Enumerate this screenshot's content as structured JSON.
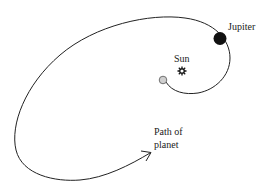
{
  "diagram": {
    "labels": {
      "jupiter": "Jupiter",
      "sun": "Sun",
      "path_line1": "Path of",
      "path_line2": "planet"
    },
    "colors": {
      "stroke": "#222222",
      "jupiter_fill": "#111111",
      "start_fill": "#cfcfcf",
      "background": "#ffffff"
    },
    "icons": {
      "sun": "sun-symbol",
      "jupiter": "filled-circle",
      "start": "hollow-gray-circle",
      "arrow": "arrowhead"
    }
  }
}
